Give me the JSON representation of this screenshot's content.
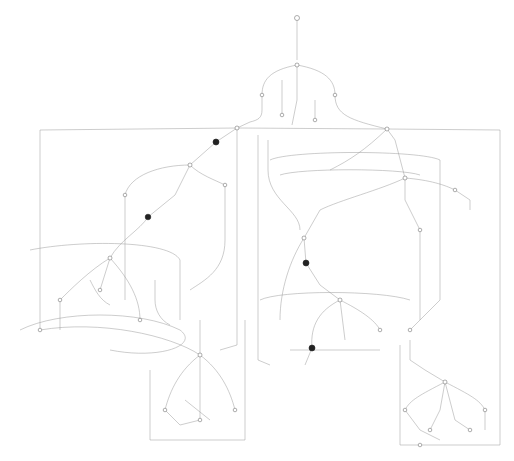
{
  "diagram": {
    "type": "state-machine",
    "colors": {
      "background": "#ffffff",
      "edge": "#9a9a9a",
      "node_stroke": "#777777",
      "filled_node": "#222222"
    },
    "start_node": {
      "x": 297,
      "y": 18
    },
    "filled_nodes": [
      {
        "x": 216,
        "y": 142
      },
      {
        "x": 148,
        "y": 217
      },
      {
        "x": 306,
        "y": 263
      },
      {
        "x": 312,
        "y": 348
      }
    ],
    "hub_nodes": [
      {
        "x": 297,
        "y": 65
      },
      {
        "x": 237,
        "y": 128
      },
      {
        "x": 387,
        "y": 129
      },
      {
        "x": 190,
        "y": 165
      },
      {
        "x": 405,
        "y": 178
      },
      {
        "x": 110,
        "y": 258
      },
      {
        "x": 304,
        "y": 238
      },
      {
        "x": 340,
        "y": 300
      },
      {
        "x": 200,
        "y": 355
      },
      {
        "x": 445,
        "y": 382
      },
      {
        "x": 40,
        "y": 325
      }
    ]
  }
}
